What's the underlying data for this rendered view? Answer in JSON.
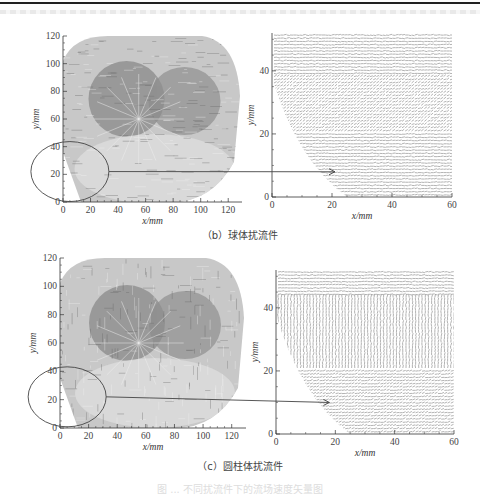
{
  "figure": {
    "caption_faded": "图 ... 不同扰流件下的流场速度矢量图",
    "panels": [
      {
        "id": "b",
        "label": "（b）球体扰流件",
        "full_field": {
          "xlabel": "x/mm",
          "ylabel": "y/mm",
          "xticks": [
            "0",
            "20",
            "40",
            "60",
            "80",
            "100",
            "120"
          ],
          "yticks": [
            "0",
            "20",
            "40",
            "60",
            "80",
            "100",
            "120"
          ],
          "xlim": [
            0,
            130
          ],
          "ylim": [
            0,
            120
          ],
          "highlight_ellipse_center": [
            5,
            22
          ]
        },
        "zoom_field": {
          "xlabel": "x/mm",
          "ylabel": "y/mm",
          "xticks": [
            "0",
            "20",
            "40",
            "60"
          ],
          "yticks": [
            "0",
            "20",
            "40"
          ],
          "xlim": [
            0,
            60
          ],
          "ylim": [
            0,
            52
          ],
          "arrow_target_y": 8
        }
      },
      {
        "id": "c",
        "label": "（c）圆柱体扰流件",
        "full_field": {
          "xlabel": "x/mm",
          "ylabel": "y/mm",
          "xticks": [
            "0",
            "20",
            "40",
            "60",
            "80",
            "100",
            "120"
          ],
          "yticks": [
            "0",
            "20",
            "40",
            "60",
            "80",
            "100",
            "120"
          ],
          "xlim": [
            0,
            130
          ],
          "ylim": [
            0,
            120
          ],
          "highlight_ellipse_center": [
            5,
            22
          ]
        },
        "zoom_field": {
          "xlabel": "x/mm",
          "ylabel": "y/mm",
          "xticks": [
            "0",
            "20",
            "40",
            "60"
          ],
          "yticks": [
            "0",
            "20",
            "40"
          ],
          "xlim": [
            0,
            60
          ],
          "ylim": [
            0,
            52
          ],
          "arrow_target_y": 10
        }
      }
    ]
  }
}
